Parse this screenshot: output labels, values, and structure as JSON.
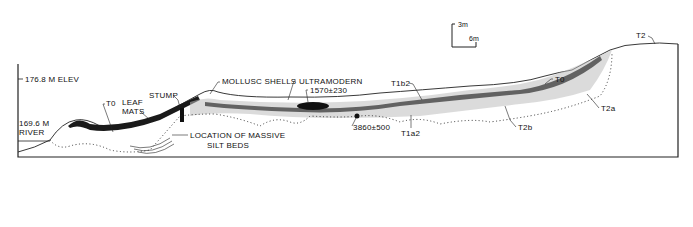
{
  "diagram": {
    "type": "geological-cross-section",
    "scale_bar": {
      "vertical": "3m",
      "horizontal": "6m"
    },
    "labels": {
      "elevation_top": "176.8 M ELEV",
      "river_elev": "169.6 M",
      "river": "RIVER",
      "to_left": "T0",
      "leaf": "LEAF",
      "mats": "MATS",
      "stump": "STUMP",
      "mollusc_shells": "MOLLUSC SHELLS",
      "ultramodern": "ULTRAMODERN",
      "date_1570": "1570±230",
      "date_3860": "3860±500",
      "location_massive": "LOCATION OF MASSIVE",
      "silt_beds": "SILT BEDS",
      "t1a2": "T1a2",
      "t1b2": "T1b2",
      "to_right": "T0",
      "t2b": "T2b",
      "t2a": "T2a",
      "t2": "T2"
    }
  }
}
